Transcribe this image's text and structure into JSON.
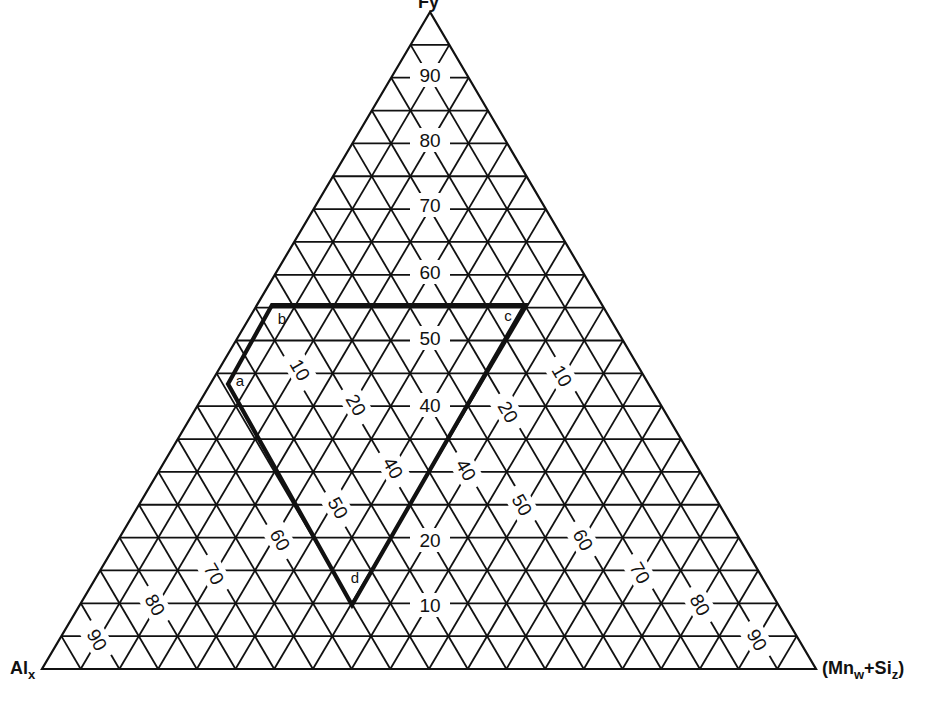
{
  "diagram": {
    "type": "ternary",
    "vertices": {
      "top": {
        "label": "F",
        "sub": "y",
        "partial": true
      },
      "left": {
        "label": "Al",
        "sub": "x"
      },
      "right": {
        "label": "(Mn",
        "sub1": "w",
        "mid": "+Si",
        "sub2": "z",
        "end": ")"
      }
    },
    "grid_step_percent": 5,
    "center_labels": [
      "90",
      "80",
      "70",
      "60",
      "50",
      "40",
      "20",
      "10"
    ],
    "left_labels": [
      "10",
      "20",
      "40",
      "50",
      "60",
      "70",
      "80",
      "90"
    ],
    "right_labels": [
      "10",
      "20",
      "40",
      "50",
      "60",
      "70",
      "80",
      "90"
    ],
    "region": {
      "points": [
        {
          "id": "a",
          "label": "a"
        },
        {
          "id": "b",
          "label": "b"
        },
        {
          "id": "c",
          "label": "c"
        },
        {
          "id": "d",
          "label": "d"
        }
      ]
    },
    "colors": {
      "line": "#111111",
      "background": "#ffffff"
    }
  }
}
